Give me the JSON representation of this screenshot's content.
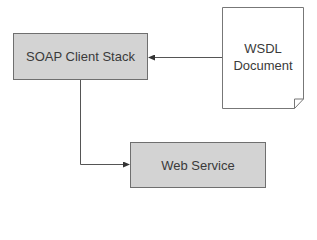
{
  "diagram": {
    "nodes": [
      {
        "id": "soap_client_stack",
        "label": "SOAP Client Stack",
        "shape": "rectangle",
        "fill": "#d3d3d3"
      },
      {
        "id": "wsdl_document",
        "label_lines": [
          "WSDL",
          "Document"
        ],
        "shape": "document",
        "fill": "#ffffff"
      },
      {
        "id": "web_service",
        "label": "Web Service",
        "shape": "rectangle",
        "fill": "#d3d3d3"
      }
    ],
    "edges": [
      {
        "from": "wsdl_document",
        "to": "soap_client_stack",
        "style": "arrow"
      },
      {
        "from": "soap_client_stack",
        "to": "web_service",
        "style": "elbow-arrow"
      }
    ],
    "colors": {
      "stroke": "#6f6f6f",
      "box_fill": "#d3d3d3",
      "text": "#3a3a3a"
    }
  }
}
